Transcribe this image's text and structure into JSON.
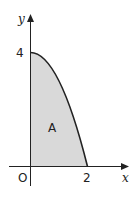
{
  "figure": {
    "type": "area-under-curve",
    "curve": "y = 4 - x^2",
    "region_label": "A",
    "axes": {
      "x_label": "x",
      "y_label": "y",
      "origin_label": "O",
      "x_ticks": [
        "2"
      ],
      "y_ticks": [
        "4"
      ]
    },
    "colors": {
      "fill": "#d9d9d9",
      "stroke": "#222222"
    }
  }
}
